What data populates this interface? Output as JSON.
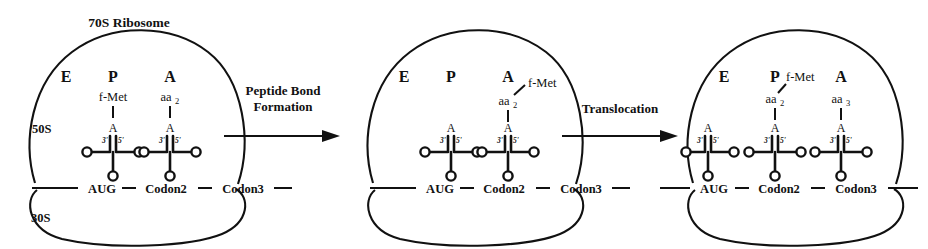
{
  "diagram": {
    "line_color": "#111111",
    "background": "#ffffff"
  },
  "panels": [
    {
      "id": "panel-initiation",
      "ribosome_label": "70S Ribosome",
      "large_subunit_label": "50S",
      "small_subunit_label": "30S",
      "sites": [
        "E",
        "P",
        "A"
      ],
      "mrna_codons": [
        "AUG",
        "Codon2",
        "Codon3"
      ],
      "trnas": [
        {
          "site": "P",
          "acceptor_base": "A",
          "three_prime": "3'",
          "five_prime": "5'",
          "cargo": "f-Met"
        },
        {
          "site": "A",
          "acceptor_base": "A",
          "three_prime": "3'",
          "five_prime": "5'",
          "cargo": "aa",
          "cargo_sub": "2"
        }
      ]
    },
    {
      "id": "panel-peptide-bond",
      "ribosome_label": "",
      "large_subunit_label": "",
      "small_subunit_label": "",
      "sites": [
        "E",
        "P",
        "A"
      ],
      "mrna_codons": [
        "AUG",
        "Codon2",
        "Codon3"
      ],
      "trnas": [
        {
          "site": "P",
          "acceptor_base": "A",
          "three_prime": "3'",
          "five_prime": "5'",
          "cargo": ""
        },
        {
          "site": "A",
          "acceptor_base": "A",
          "three_prime": "3'",
          "five_prime": "5'",
          "cargo": "aa",
          "cargo_sub": "2",
          "cargo_attached": "f-Met"
        }
      ]
    },
    {
      "id": "panel-translocation",
      "ribosome_label": "",
      "large_subunit_label": "",
      "small_subunit_label": "",
      "sites": [
        "E",
        "P",
        "A"
      ],
      "mrna_codons": [
        "AUG",
        "Codon2",
        "Codon3"
      ],
      "trnas": [
        {
          "site": "E",
          "acceptor_base": "A",
          "three_prime": "3'",
          "five_prime": "5'",
          "cargo": ""
        },
        {
          "site": "P",
          "acceptor_base": "A",
          "three_prime": "3'",
          "five_prime": "5'",
          "cargo": "aa",
          "cargo_sub": "2",
          "cargo_attached": "f-Met"
        },
        {
          "site": "A",
          "acceptor_base": "A",
          "three_prime": "3'",
          "five_prime": "5'",
          "cargo": "aa",
          "cargo_sub": "3"
        }
      ]
    }
  ],
  "steps": [
    {
      "id": "step-peptide-bond",
      "line1": "Peptide Bond",
      "line2": "Formation"
    },
    {
      "id": "step-translocation",
      "line1": "Translocation",
      "line2": ""
    }
  ]
}
